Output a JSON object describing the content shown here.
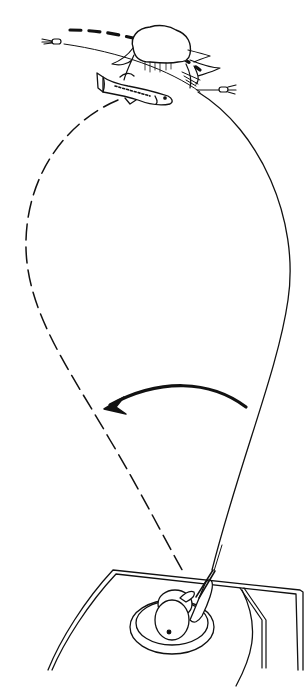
{
  "diagram": {
    "type": "line-art-illustration",
    "subject": "casting technique around a stump",
    "colors": {
      "ink": "#111111",
      "background": "#ffffff"
    },
    "elements": {
      "stump": {
        "label": "stump with roots",
        "position": [
          155,
          60
        ]
      },
      "fish": {
        "label": "bass",
        "position": [
          150,
          92
        ]
      },
      "lure_left": {
        "label": "lure",
        "position": [
          52,
          41
        ]
      },
      "lure_right": {
        "label": "lure",
        "position": [
          226,
          90
        ]
      },
      "boat": {
        "label": "boat bow"
      },
      "angler": {
        "label": "angler with rod"
      },
      "arrow": {
        "label": "rod sweep direction",
        "direction": "right-to-left"
      },
      "cast_path_dashed": {
        "label": "lure path (dashed)",
        "style": "dashed"
      },
      "cast_path_solid": {
        "label": "fishing line (solid)",
        "style": "solid"
      },
      "overhead_dashed": {
        "label": "cast trajectory over stump",
        "style": "heavy-dashed"
      }
    }
  }
}
